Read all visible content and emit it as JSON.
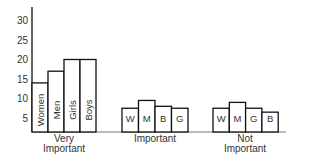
{
  "chart_data": {
    "type": "bar",
    "title": "",
    "xlabel": "",
    "ylabel": "",
    "ylim": [
      0,
      32
    ],
    "yticks": [
      5,
      10,
      15,
      20,
      25,
      30
    ],
    "grid": false,
    "legend": "none (bars labeled inline)",
    "categories": [
      "Very Important",
      "Important",
      "Not Important"
    ],
    "category_lines": [
      [
        "Very",
        "Important"
      ],
      [
        "Important"
      ],
      [
        "Not",
        "Important"
      ]
    ],
    "groups": [
      {
        "category": "Very Important",
        "bars": [
          {
            "label": "Women",
            "value": 14,
            "vertical": true
          },
          {
            "label": "Men",
            "value": 17,
            "vertical": true
          },
          {
            "label": "Girls",
            "value": 20,
            "vertical": true
          },
          {
            "label": "Boys",
            "value": 20,
            "vertical": true
          }
        ]
      },
      {
        "category": "Important",
        "bars": [
          {
            "label": "W",
            "value": 7.5
          },
          {
            "label": "M",
            "value": 9.5
          },
          {
            "label": "B",
            "value": 8
          },
          {
            "label": "G",
            "value": 7.5
          }
        ]
      },
      {
        "category": "Not Important",
        "bars": [
          {
            "label": "W",
            "value": 7.5
          },
          {
            "label": "M",
            "value": 9
          },
          {
            "label": "G",
            "value": 7.5
          },
          {
            "label": "B",
            "value": 6.5
          }
        ]
      }
    ],
    "series": [
      {
        "name": "Women",
        "values": [
          14,
          7.5,
          7.5
        ]
      },
      {
        "name": "Men",
        "values": [
          17,
          9.5,
          9
        ]
      },
      {
        "name": "Girls",
        "values": [
          20,
          7.5,
          7.5
        ]
      },
      {
        "name": "Boys",
        "values": [
          20,
          8,
          6.5
        ]
      }
    ]
  }
}
